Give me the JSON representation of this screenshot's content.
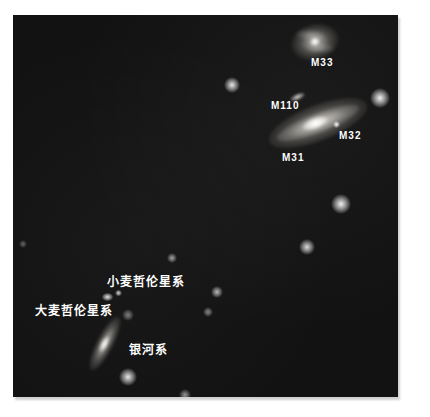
{
  "photo": {
    "background_color": "#121212",
    "label_color": "#ffffff",
    "galaxy_glow_color": "#fdfcf8"
  },
  "labels": {
    "m33": "M33",
    "m110": "M110",
    "m31": "M31",
    "m32": "M32",
    "smc": "小麦哲伦星系",
    "lmc": "大麦哲伦星系",
    "milky_way": "银河系"
  },
  "objects": [
    {
      "label": "M33",
      "appearance": "face-on spiral galaxy, upper right"
    },
    {
      "label": "M110",
      "appearance": "small elongated companion galaxy"
    },
    {
      "label": "M31",
      "appearance": "large inclined spiral galaxy (Andromeda)"
    },
    {
      "label": "M32",
      "appearance": "compact point-like companion"
    },
    {
      "label": "小麦哲伦星系",
      "appearance": "small fuzzy cloud"
    },
    {
      "label": "大麦哲伦星系",
      "appearance": "slightly larger fuzzy cloud"
    },
    {
      "label": "银河系",
      "appearance": "edge-on spiral galaxy, lower left"
    }
  ],
  "dots": [
    {
      "x": 219,
      "y": 70,
      "r": 4,
      "opacity": 0.9
    },
    {
      "x": 367,
      "y": 83,
      "r": 5,
      "opacity": 0.95
    },
    {
      "x": 328,
      "y": 189,
      "r": 5,
      "opacity": 0.95
    },
    {
      "x": 294,
      "y": 232,
      "r": 4,
      "opacity": 0.85
    },
    {
      "x": 159,
      "y": 243,
      "r": 2.5,
      "opacity": 0.6
    },
    {
      "x": 204,
      "y": 277,
      "r": 3,
      "opacity": 0.7
    },
    {
      "x": 195,
      "y": 297,
      "r": 2.5,
      "opacity": 0.5
    },
    {
      "x": 115,
      "y": 300,
      "r": 3,
      "opacity": 0.45
    },
    {
      "x": 115,
      "y": 362,
      "r": 4.5,
      "opacity": 0.9
    },
    {
      "x": 10,
      "y": 229,
      "r": 2,
      "opacity": 0.35
    },
    {
      "x": 172,
      "y": 380,
      "r": 3,
      "opacity": 0.55
    }
  ]
}
